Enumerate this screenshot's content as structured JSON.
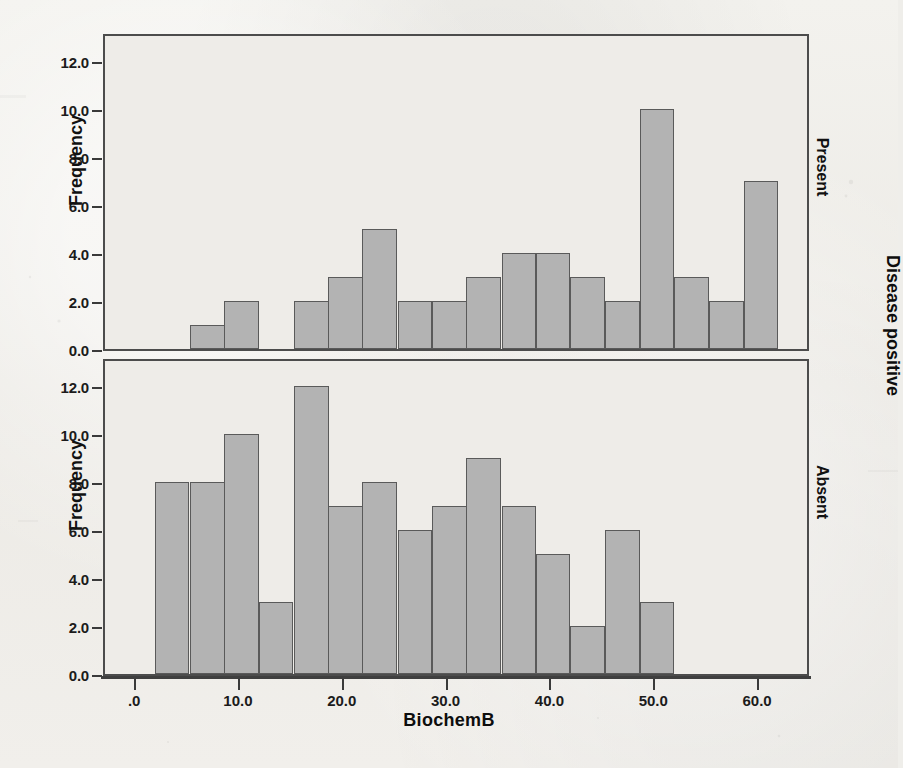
{
  "chart_data": {
    "type": "bar",
    "title": "",
    "xlabel": "BiochemB",
    "ylabel": "Frequency",
    "xlim": [
      -3.0,
      65.0
    ],
    "ylim": [
      0.0,
      13.2
    ],
    "grid": false,
    "legend_position": "none",
    "xticks": [
      ".0",
      "10.0",
      "20.0",
      "30.0",
      "40.0",
      "50.0",
      "60.0"
    ],
    "xtick_values": [
      0,
      10,
      20,
      30,
      40,
      50,
      60
    ],
    "yticks": [
      "0.0",
      "2.0",
      "4.0",
      "6.0",
      "8.0",
      "10.0",
      "12.0"
    ],
    "ytick_values": [
      0,
      2,
      4,
      6,
      8,
      10,
      12
    ],
    "bin_width": 3.33,
    "bar_color": "#b3b3b3",
    "bar_edge_color": "#5a5a5a",
    "panel_label_outer": "Disease positive",
    "panels": [
      {
        "name": "present",
        "label": "Present",
        "bin_starts": [
          5.2,
          8.5,
          11.8,
          15.2,
          18.5,
          21.8,
          25.2,
          28.5,
          31.8,
          35.2,
          38.5,
          41.8,
          45.2,
          48.5,
          51.8,
          55.2
        ],
        "values": [
          1,
          2,
          0,
          2,
          3,
          5,
          2,
          2,
          3,
          4,
          4,
          3,
          2,
          10,
          3,
          2,
          7
        ],
        "bars": [
          {
            "start": 5.2,
            "value": 1
          },
          {
            "start": 8.5,
            "value": 2
          },
          {
            "start": 15.2,
            "value": 2
          },
          {
            "start": 18.5,
            "value": 3
          },
          {
            "start": 21.8,
            "value": 5
          },
          {
            "start": 25.2,
            "value": 2
          },
          {
            "start": 28.5,
            "value": 2
          },
          {
            "start": 31.8,
            "value": 3
          },
          {
            "start": 35.2,
            "value": 4
          },
          {
            "start": 38.5,
            "value": 4
          },
          {
            "start": 41.8,
            "value": 3
          },
          {
            "start": 45.2,
            "value": 2
          },
          {
            "start": 48.5,
            "value": 10
          },
          {
            "start": 51.8,
            "value": 3
          },
          {
            "start": 55.2,
            "value": 2
          },
          {
            "start": 58.5,
            "value": 7
          }
        ]
      },
      {
        "name": "absent",
        "label": "Absent",
        "bars": [
          {
            "start": 1.8,
            "value": 8
          },
          {
            "start": 5.2,
            "value": 8
          },
          {
            "start": 8.5,
            "value": 10
          },
          {
            "start": 11.8,
            "value": 3
          },
          {
            "start": 15.2,
            "value": 12
          },
          {
            "start": 18.5,
            "value": 7
          },
          {
            "start": 21.8,
            "value": 8
          },
          {
            "start": 25.2,
            "value": 6
          },
          {
            "start": 28.5,
            "value": 7
          },
          {
            "start": 31.8,
            "value": 9
          },
          {
            "start": 35.2,
            "value": 7
          },
          {
            "start": 38.5,
            "value": 5
          },
          {
            "start": 41.8,
            "value": 2
          },
          {
            "start": 45.2,
            "value": 6
          },
          {
            "start": 48.5,
            "value": 3
          }
        ]
      }
    ]
  }
}
